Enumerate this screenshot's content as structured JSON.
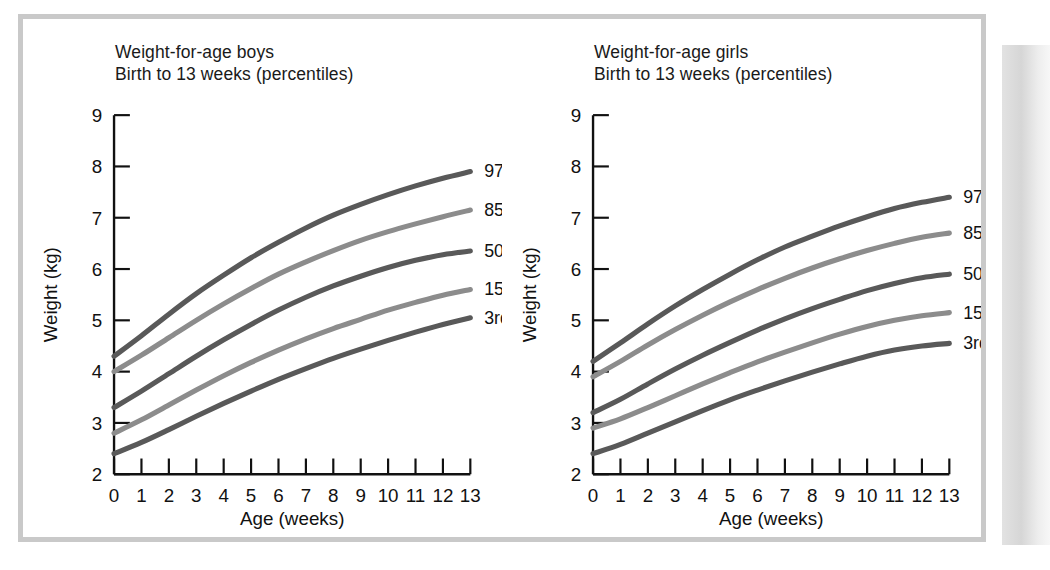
{
  "figure": {
    "caption_kind": "growth-chart-figure",
    "border_color": "#c9c9c9",
    "background": "#ffffff"
  },
  "chart_data": [
    {
      "type": "line",
      "panel": "boys",
      "title": "Weight-for-age boys\nBirth to 13 weeks (percentiles)",
      "title_line1": "Weight-for-age boys",
      "title_line2": "Birth to 13 weeks (percentiles)",
      "xlabel": "Age (weeks)",
      "ylabel": "Weight (kg)",
      "xlim": [
        0,
        13
      ],
      "ylim": [
        2,
        9
      ],
      "xticks": [
        0,
        1,
        2,
        3,
        4,
        5,
        6,
        7,
        8,
        9,
        10,
        11,
        12,
        13
      ],
      "yticks": [
        2,
        3,
        4,
        5,
        6,
        7,
        8,
        9
      ],
      "xticklabels": [
        "0",
        "1",
        "2",
        "3",
        "4",
        "5",
        "6",
        "7",
        "8",
        "9",
        "10",
        "11",
        "12",
        "13"
      ],
      "yticklabels": [
        "2",
        "3",
        "4",
        "5",
        "6",
        "7",
        "8",
        "9"
      ],
      "grid": false,
      "legend_position": "right-of-curve-ends",
      "x": [
        0,
        1,
        2,
        3,
        4,
        5,
        6,
        7,
        8,
        9,
        10,
        11,
        12,
        13
      ],
      "series": [
        {
          "name": "97th",
          "label": "97th",
          "color": "#595959",
          "values": [
            4.3,
            4.7,
            5.12,
            5.52,
            5.88,
            6.22,
            6.52,
            6.8,
            7.05,
            7.26,
            7.45,
            7.62,
            7.77,
            7.9
          ]
        },
        {
          "name": "85th",
          "label": "85th",
          "color": "#8c8c8c",
          "values": [
            4.0,
            4.32,
            4.66,
            5.0,
            5.32,
            5.62,
            5.9,
            6.14,
            6.36,
            6.56,
            6.73,
            6.88,
            7.02,
            7.15
          ]
        },
        {
          "name": "50th",
          "label": "50th",
          "color": "#595959",
          "values": [
            3.3,
            3.62,
            3.96,
            4.3,
            4.62,
            4.92,
            5.2,
            5.45,
            5.67,
            5.86,
            6.03,
            6.17,
            6.28,
            6.35
          ]
        },
        {
          "name": "15th",
          "label": "15th",
          "color": "#8c8c8c",
          "values": [
            2.8,
            3.06,
            3.35,
            3.64,
            3.92,
            4.18,
            4.42,
            4.64,
            4.84,
            5.02,
            5.2,
            5.35,
            5.49,
            5.6
          ]
        },
        {
          "name": "3rd",
          "label": "3rd",
          "color": "#595959",
          "values": [
            2.4,
            2.62,
            2.87,
            3.13,
            3.38,
            3.62,
            3.85,
            4.06,
            4.26,
            4.44,
            4.61,
            4.77,
            4.92,
            5.05
          ]
        }
      ]
    },
    {
      "type": "line",
      "panel": "girls",
      "title": "Weight-for-age girls\nBirth to 13 weeks (percentiles)",
      "title_line1": "Weight-for-age girls",
      "title_line2": "Birth to 13 weeks (percentiles)",
      "xlabel": "Age (weeks)",
      "ylabel": "Weight (kg)",
      "xlim": [
        0,
        13
      ],
      "ylim": [
        2,
        9
      ],
      "xticks": [
        0,
        1,
        2,
        3,
        4,
        5,
        6,
        7,
        8,
        9,
        10,
        11,
        12,
        13
      ],
      "yticks": [
        2,
        3,
        4,
        5,
        6,
        7,
        8,
        9
      ],
      "xticklabels": [
        "0",
        "1",
        "2",
        "3",
        "4",
        "5",
        "6",
        "7",
        "8",
        "9",
        "10",
        "11",
        "12",
        "13"
      ],
      "yticklabels": [
        "2",
        "3",
        "4",
        "5",
        "6",
        "7",
        "8",
        "9"
      ],
      "grid": false,
      "legend_position": "right-of-curve-ends",
      "x": [
        0,
        1,
        2,
        3,
        4,
        5,
        6,
        7,
        8,
        9,
        10,
        11,
        12,
        13
      ],
      "series": [
        {
          "name": "97th",
          "label": "97th",
          "color": "#595959",
          "values": [
            4.2,
            4.56,
            4.93,
            5.28,
            5.6,
            5.9,
            6.18,
            6.43,
            6.64,
            6.84,
            7.02,
            7.18,
            7.3,
            7.4
          ]
        },
        {
          "name": "85th",
          "label": "85th",
          "color": "#8c8c8c",
          "values": [
            3.9,
            4.2,
            4.52,
            4.82,
            5.1,
            5.36,
            5.6,
            5.82,
            6.02,
            6.2,
            6.36,
            6.5,
            6.62,
            6.7
          ]
        },
        {
          "name": "50th",
          "label": "50th",
          "color": "#595959",
          "values": [
            3.2,
            3.46,
            3.76,
            4.05,
            4.32,
            4.57,
            4.81,
            5.03,
            5.23,
            5.41,
            5.58,
            5.72,
            5.83,
            5.9
          ]
        },
        {
          "name": "15th",
          "label": "15th",
          "color": "#8c8c8c",
          "values": [
            2.9,
            3.08,
            3.3,
            3.53,
            3.76,
            3.98,
            4.19,
            4.38,
            4.56,
            4.73,
            4.88,
            5.0,
            5.09,
            5.15
          ]
        },
        {
          "name": "3rd",
          "label": "3rd",
          "color": "#595959",
          "values": [
            2.4,
            2.58,
            2.8,
            3.02,
            3.24,
            3.45,
            3.64,
            3.82,
            3.99,
            4.15,
            4.3,
            4.42,
            4.5,
            4.55
          ]
        }
      ]
    }
  ]
}
